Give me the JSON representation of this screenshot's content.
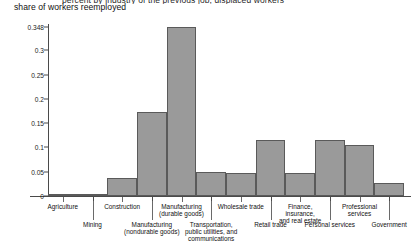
{
  "figure": {
    "clipped_title": "percent by industry of the previous job, displaced workers",
    "subtitle": "share of workers reemployed"
  },
  "axes": {
    "y_ticks": [
      "0",
      "0.05",
      "0.1",
      "0.15",
      "0.2",
      "0.25",
      "0.3",
      "0.348"
    ]
  },
  "chart_data": {
    "type": "bar",
    "title": "share of workers reemployed",
    "xlabel": "",
    "ylabel": "",
    "ylim": [
      0,
      0.348
    ],
    "grid": false,
    "legend": null,
    "bar_gap": 0,
    "fill_color": "#9a9a9a",
    "edge_color": "#5a5a5a",
    "y_tick_values": [
      0,
      0.05,
      0.1,
      0.15,
      0.2,
      0.25,
      0.3,
      0.348
    ],
    "y_tick_labels": [
      "0",
      "0.05",
      "0.1",
      "0.15",
      "0.2",
      "0.25",
      "0.3",
      "0.348"
    ],
    "categories": [
      "Agriculture",
      "Mining",
      "Construction",
      "Manufacturing (nondurable goods)",
      "Manufacturing (durable goods)",
      "Transportation, public utilities, and communications",
      "Wholesale trade",
      "Retail trade",
      "Finance, insurance, and real estate",
      "Personal services",
      "Professional services",
      "Government"
    ],
    "values": [
      0.005,
      0.005,
      0.037,
      0.172,
      0.348,
      0.05,
      0.048,
      0.115,
      0.048,
      0.115,
      0.105,
      0.027
    ]
  },
  "x_labels": [
    {
      "text": "Agriculture",
      "row": "a"
    },
    {
      "text": "Mining",
      "row": "b"
    },
    {
      "text": "Construction",
      "row": "a"
    },
    {
      "text": "Manufacturing\n(nondurable goods)",
      "row": "b"
    },
    {
      "text": "Manufacturing\n(durable goods)",
      "row": "a"
    },
    {
      "text": "Transportation,\npublic utilities, and\ncommunications",
      "row": "b"
    },
    {
      "text": "Wholesale trade",
      "row": "a"
    },
    {
      "text": "Retail trade",
      "row": "b"
    },
    {
      "text": "Finance, insurance,\nand real estate",
      "row": "a"
    },
    {
      "text": "Personal services",
      "row": "b"
    },
    {
      "text": "Professional\nservices",
      "row": "a"
    },
    {
      "text": "Government",
      "row": "b"
    }
  ]
}
